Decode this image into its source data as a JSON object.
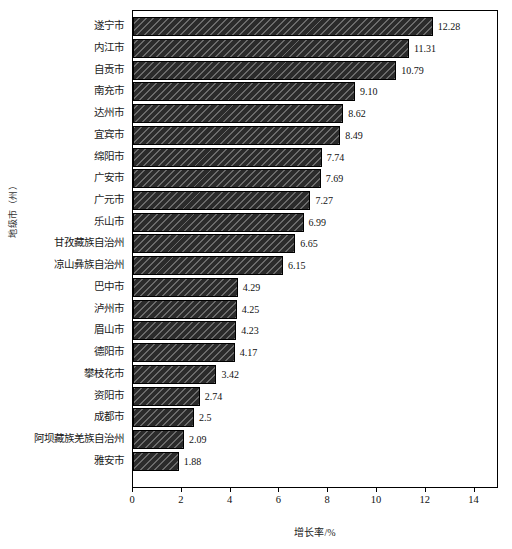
{
  "chart_data": {
    "type": "bar",
    "orientation": "horizontal",
    "title": "",
    "xlabel": "增长率/%",
    "ylabel": "地级市（州）",
    "xlim": [
      0,
      15
    ],
    "xticks": [
      0,
      2,
      4,
      6,
      8,
      10,
      12,
      14
    ],
    "xtick_labels": [
      "0",
      "2",
      "4",
      "6",
      "8",
      "10",
      "12",
      "14"
    ],
    "grid": false,
    "legend": false,
    "bar_color": "#2b2b2b",
    "bar_hatch": "diagonal",
    "categories": [
      "遂宁市",
      "内江市",
      "自贡市",
      "南充市",
      "达州市",
      "宜宾市",
      "绵阳市",
      "广安市",
      "广元市",
      "乐山市",
      "甘孜藏族自治州",
      "凉山彝族自治州",
      "巴中市",
      "泸州市",
      "眉山市",
      "德阳市",
      "攀枝花市",
      "资阳市",
      "成都市",
      "阿坝藏族羌族自治州",
      "雅安市"
    ],
    "values": [
      12.28,
      11.31,
      10.79,
      9.1,
      8.62,
      8.49,
      7.74,
      7.69,
      7.27,
      6.99,
      6.65,
      6.15,
      4.29,
      4.25,
      4.23,
      4.17,
      3.42,
      2.74,
      2.5,
      2.09,
      1.88
    ],
    "value_labels": [
      "12.28",
      "11.31",
      "10.79",
      "9.10",
      "8.62",
      "8.49",
      "7.74",
      "7.69",
      "7.27",
      "6.99",
      "6.65",
      "6.15",
      "4.29",
      "4.25",
      "4.23",
      "4.17",
      "3.42",
      "2.74",
      "2.5",
      "2.09",
      "1.88"
    ]
  }
}
